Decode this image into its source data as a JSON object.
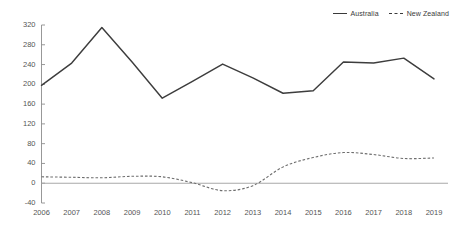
{
  "legend": {
    "position": "top-right",
    "entries": [
      {
        "label": "Australia",
        "style": "solid",
        "color": "#3d3d3d"
      },
      {
        "label": "New Zealand",
        "style": "dashed",
        "color": "#6e6e6e"
      }
    ]
  },
  "axes": {
    "y_ticks": [
      "-40",
      "0",
      "40",
      "80",
      "120",
      "160",
      "200",
      "240",
      "280",
      "320"
    ],
    "x_ticks": [
      "2006",
      "2007",
      "2008",
      "2009",
      "2010",
      "2011",
      "2012",
      "2013",
      "2014",
      "2015",
      "2016",
      "2017",
      "2018",
      "2019"
    ]
  },
  "chart_data": {
    "type": "line",
    "title": "",
    "subtitle": "",
    "xlabel": "",
    "ylabel": "",
    "grid": false,
    "legend_position": "top-right",
    "categories": [
      2006,
      2007,
      2008,
      2009,
      2010,
      2011,
      2012,
      2013,
      2014,
      2015,
      2016,
      2017,
      2018,
      2019
    ],
    "x": [
      2006,
      2007,
      2008,
      2009,
      2010,
      2011,
      2012,
      2013,
      2014,
      2015,
      2016,
      2017,
      2018,
      2019
    ],
    "xlim": [
      2006,
      2019
    ],
    "ylim": [
      -40,
      320
    ],
    "yticks": [
      -40,
      0,
      40,
      80,
      120,
      160,
      200,
      240,
      280,
      320
    ],
    "series": [
      {
        "name": "Australia",
        "style": "solid",
        "color": "#3d3d3d",
        "smoothed": false,
        "values": [
          198,
          243,
          315,
          245,
          172,
          206,
          241,
          213,
          182,
          187,
          245,
          243,
          253,
          211
        ]
      },
      {
        "name": "New Zealand",
        "style": "dashed",
        "color": "#6e6e6e",
        "smoothed": true,
        "values": [
          13,
          12,
          11,
          14,
          13,
          1,
          -15,
          -5,
          33,
          52,
          62,
          58,
          50,
          51
        ]
      }
    ]
  }
}
